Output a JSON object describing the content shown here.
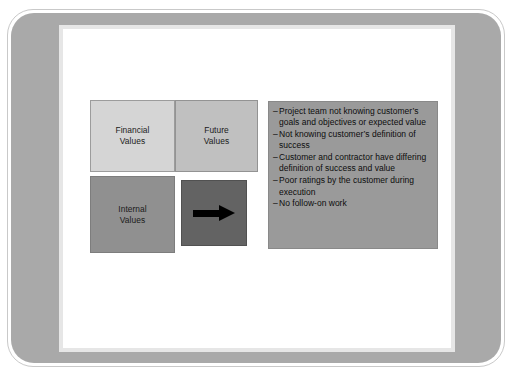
{
  "slide": {
    "background_color": "#ffffff",
    "frame_color": "#a9a9a9"
  },
  "matrix": {
    "name": "values-matrix",
    "cells": [
      {
        "id": "financial",
        "label": "Financial\nValues",
        "color": "#d5d5d5"
      },
      {
        "id": "future",
        "label": "Future\nValues",
        "color": "#c0c0c0"
      },
      {
        "id": "internal",
        "label": "Internal\nValues",
        "color": "#909090"
      },
      {
        "id": "arrow",
        "label": "",
        "color": "#636363",
        "icon": "right-arrow-icon"
      }
    ],
    "labels": {
      "financial_line1": "Financial",
      "financial_line2": "Values",
      "future_line1": "Future",
      "future_line2": "Values",
      "internal_line1": "Internal",
      "internal_line2": "Values"
    }
  },
  "issues": {
    "background_color": "#9a9a9a",
    "bullet_marker": "–",
    "items": [
      "Project team not knowing customer’s goals and objectives or expected value",
      "Not knowing customer’s definition of success",
      "Customer and contractor have differing definition of success and value",
      "Poor ratings by the customer during execution",
      "No follow-on work"
    ]
  }
}
